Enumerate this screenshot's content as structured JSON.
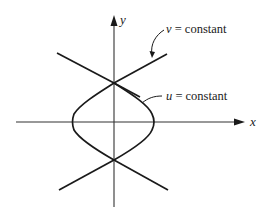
{
  "figure": {
    "axes": {
      "x_label": "x",
      "y_label": "y"
    },
    "annotations": {
      "v_curve": {
        "variable": "v",
        "text": " = constant"
      },
      "u_curve": {
        "variable": "u",
        "text": " = constant"
      }
    },
    "colors": {
      "line": "#1a1a1a",
      "axis": "#333333",
      "background": "#ffffff"
    }
  }
}
